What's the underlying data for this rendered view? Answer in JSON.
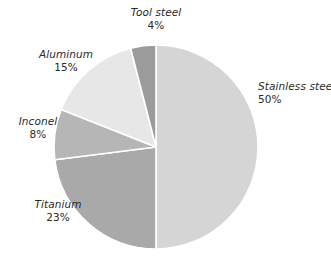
{
  "chart_data": {
    "type": "pie",
    "title": "",
    "subtitle": "",
    "xlabel": "",
    "ylabel": "",
    "legend_position": "none",
    "grid": false,
    "start_angle_deg": 0,
    "direction": "clockwise",
    "units": "percent",
    "categories": [
      "Stainless steel",
      "Titanium",
      "Inconel",
      "Aluminum",
      "Tool steel"
    ],
    "values": [
      50,
      23,
      8,
      15,
      4
    ],
    "labels": [
      "50%",
      "23%",
      "8%",
      "15%",
      "4%"
    ],
    "colors": [
      "#d5d5d5",
      "#a9a9a9",
      "#b6b6b6",
      "#e7e7e7",
      "#9b9b9b"
    ],
    "slices": [
      {
        "name": "Stainless steel",
        "value": 50,
        "label": "50%",
        "color": "#d5d5d5"
      },
      {
        "name": "Titanium",
        "value": 23,
        "label": "23%",
        "color": "#a9a9a9"
      },
      {
        "name": "Inconel",
        "value": 8,
        "label": "8%",
        "color": "#b6b6b6"
      },
      {
        "name": "Aluminum",
        "value": 15,
        "label": "15%",
        "color": "#e7e7e7"
      },
      {
        "name": "Tool steel",
        "value": 4,
        "label": "4%",
        "color": "#9b9b9b"
      }
    ]
  },
  "appearance": {
    "background": "#ffffff",
    "separator_color": "#ffffff",
    "text_color": "#2a2a2a"
  },
  "geometry": {
    "center_x": 156,
    "center_y": 147,
    "radius": 102
  }
}
